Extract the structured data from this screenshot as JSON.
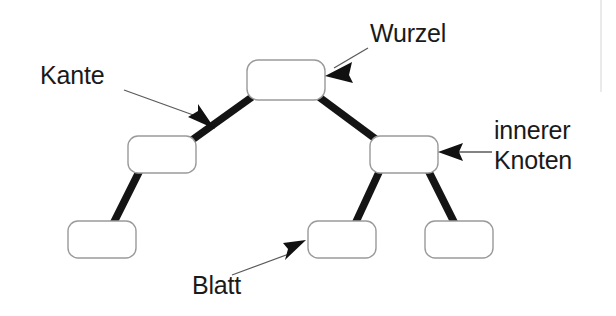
{
  "diagram": {
    "background_color": "#ffffff",
    "node_fill": "#ffffff",
    "node_stroke": "#9a9a9a",
    "edge_color": "#141414",
    "leader_color": "#5a5a5a",
    "text_color": "#1a1a1a"
  },
  "labels": {
    "root": "Wurzel",
    "edge": "Kante",
    "inner_line1": "innerer",
    "inner_line2": "Knoten",
    "leaf": "Blatt"
  },
  "tree": {
    "nodes": [
      {
        "id": "root",
        "role": "root",
        "x": 247,
        "y": 60,
        "w": 78,
        "h": 40,
        "label": ""
      },
      {
        "id": "inner-left",
        "role": "inner-node",
        "x": 128,
        "y": 136,
        "w": 68,
        "h": 37,
        "label": ""
      },
      {
        "id": "inner-right",
        "role": "inner-node",
        "x": 370,
        "y": 136,
        "w": 68,
        "h": 37,
        "label": ""
      },
      {
        "id": "leaf-left",
        "role": "leaf",
        "x": 68,
        "y": 221,
        "w": 68,
        "h": 37,
        "label": ""
      },
      {
        "id": "leaf-mid",
        "role": "leaf",
        "x": 308,
        "y": 221,
        "w": 68,
        "h": 37,
        "label": ""
      },
      {
        "id": "leaf-right",
        "role": "leaf",
        "x": 425,
        "y": 221,
        "w": 68,
        "h": 37,
        "label": ""
      }
    ],
    "edges": [
      {
        "from": "root",
        "to": "inner-left"
      },
      {
        "from": "root",
        "to": "inner-right"
      },
      {
        "from": "inner-left",
        "to": "leaf-left"
      },
      {
        "from": "inner-right",
        "to": "leaf-mid"
      },
      {
        "from": "inner-right",
        "to": "leaf-right"
      }
    ],
    "annotations": [
      {
        "id": "wurzel",
        "label": "Wurzel",
        "points_to": "root",
        "arrow_direction": "left-down"
      },
      {
        "id": "kante",
        "label": "Kante",
        "points_to": "edge-root-inner-left",
        "arrow_direction": "right-down"
      },
      {
        "id": "inner",
        "label": "innerer Knoten",
        "points_to": "inner-right",
        "arrow_direction": "left"
      },
      {
        "id": "blatt",
        "label": "Blatt",
        "points_to": "leaf-mid",
        "arrow_direction": "right-up"
      }
    ]
  }
}
